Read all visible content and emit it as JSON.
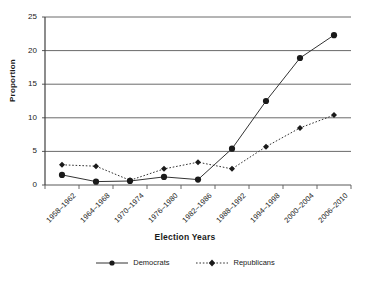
{
  "chart_data": {
    "type": "line",
    "title": "",
    "xlabel": "Election Years",
    "ylabel": "Proportion",
    "categories": [
      "1958–1962",
      "1964–1968",
      "1970–1974",
      "1976–1980",
      "1982–1986",
      "1988–1992",
      "1994–1998",
      "2000–2004",
      "2006–2010"
    ],
    "series": [
      {
        "name": "Democrats",
        "values": [
          1.5,
          0.5,
          0.6,
          1.2,
          0.8,
          5.4,
          12.5,
          18.9,
          22.3
        ],
        "line_style": "solid",
        "marker": "circle",
        "color": "#333333"
      },
      {
        "name": "Republicans",
        "values": [
          3.0,
          2.8,
          0.7,
          2.4,
          3.4,
          2.4,
          5.7,
          8.5,
          10.4
        ],
        "line_style": "dotted",
        "marker": "diamond",
        "color": "#333333"
      }
    ],
    "ylim": [
      0,
      25
    ],
    "yticks": [
      0,
      5,
      10,
      15,
      20,
      25
    ],
    "ytick_labels": [
      "0",
      "5",
      "10",
      "15",
      "20",
      "25"
    ],
    "grid": true,
    "grid_axis": "y",
    "legend_position": "bottom"
  },
  "axes": {
    "y_title": "Proportion",
    "x_title": "Election Years"
  },
  "legend": {
    "items": [
      {
        "label": "Democrats"
      },
      {
        "label": "Republicans"
      }
    ]
  }
}
